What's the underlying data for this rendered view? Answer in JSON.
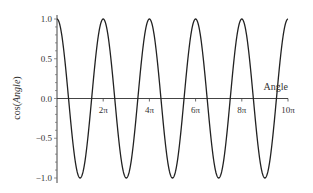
{
  "chart_data": {
    "type": "line",
    "title": "",
    "xlabel": "Angle",
    "ylabel": "cos(Angle)",
    "xlim": [
      0,
      31.4159
    ],
    "ylim": [
      -1.0,
      1.0
    ],
    "grid": false,
    "legend": null,
    "x_ticks": [
      {
        "value": 6.2832,
        "label": "2π"
      },
      {
        "value": 12.5664,
        "label": "4π"
      },
      {
        "value": 18.8496,
        "label": "6π"
      },
      {
        "value": 25.1327,
        "label": "8π"
      },
      {
        "value": 31.4159,
        "label": "10π"
      }
    ],
    "y_ticks": [
      {
        "value": 1.0,
        "label": "1.0"
      },
      {
        "value": 0.5,
        "label": "0.5"
      },
      {
        "value": 0.0,
        "label": "0.0"
      },
      {
        "value": -0.5,
        "label": "-0.5"
      },
      {
        "value": -1.0,
        "label": "-1.0"
      }
    ],
    "series": [
      {
        "name": "cos(Angle)",
        "function": "cos(x)",
        "color": "#222222",
        "x_range": [
          0,
          31.4159
        ],
        "x": [
          0,
          3.1416,
          6.2832,
          9.4248,
          12.5664,
          15.708,
          18.8496,
          21.9911,
          25.1327,
          28.2743,
          31.4159
        ],
        "values": [
          1,
          -1,
          1,
          -1,
          1,
          -1,
          1,
          -1,
          1,
          -1,
          1
        ]
      }
    ]
  },
  "labels": {
    "xlabel": "Angle",
    "ylabel_prefix": "cos(",
    "ylabel_italic": "Angle",
    "ylabel_suffix": ")"
  }
}
